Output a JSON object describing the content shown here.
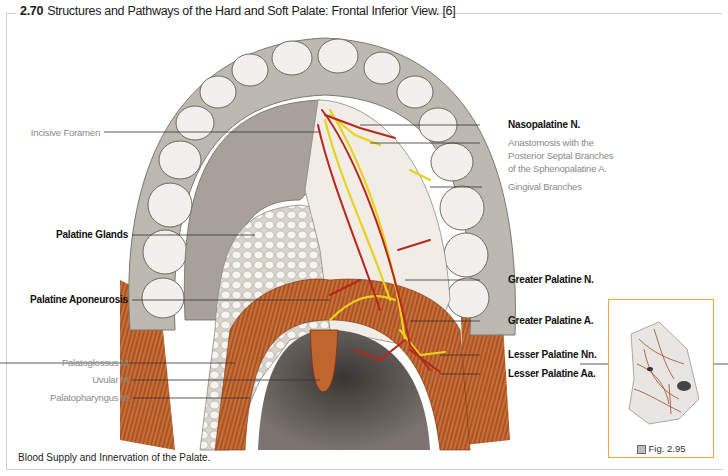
{
  "figure": {
    "number": "2.70",
    "title": "Structures and Pathways of the Hard and Soft Palate: Frontal Inferior View. [6]",
    "caption": "Blood Supply and Innervation of the Palate."
  },
  "labels_left": [
    {
      "text": "Incisive Foramen",
      "style": "gray"
    },
    {
      "text": "Palatine Glands",
      "style": "bold"
    },
    {
      "text": "Palatine Aponeurosis",
      "style": "bold"
    },
    {
      "text": "Palatoglossus M.",
      "style": "gray"
    },
    {
      "text": "Uvular M.",
      "style": "gray"
    },
    {
      "text": "Palatopharyngus M.",
      "style": "gray"
    }
  ],
  "labels_right": [
    {
      "text": "Nasopalatine N.",
      "style": "bold"
    },
    {
      "text": "Anastomosis with the",
      "style": "gray"
    },
    {
      "text": "Posterior Septal Branches",
      "style": "gray"
    },
    {
      "text": "of the Sphenopalatine A.",
      "style": "gray"
    },
    {
      "text": "Gingival Branches",
      "style": "gray"
    },
    {
      "text": "Greater Palatine N.",
      "style": "bold"
    },
    {
      "text": "Greater Palatine A.",
      "style": "bold"
    },
    {
      "text": "Lesser Palatine Nn.",
      "style": "bold"
    },
    {
      "text": "Lesser Palatine Aa.",
      "style": "bold"
    }
  ],
  "thumbnail": {
    "label": "Fig. 2.95",
    "icon": "figure-reference-icon",
    "border_color": "#f0a830"
  },
  "colors": {
    "artery": "#b8261c",
    "nerve": "#e8d21a",
    "muscle": "#c0652e",
    "bone": "#c8c4bc",
    "gland": "#f4f2ee"
  }
}
